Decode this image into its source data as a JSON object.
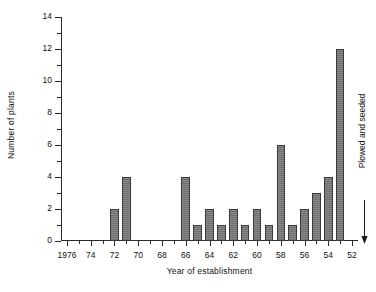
{
  "chart_data": {
    "type": "bar",
    "title": "",
    "xlabel": "Year of establishment",
    "ylabel": "Number of plants",
    "grid": false,
    "legend": null,
    "xlim": [
      1976.5,
      1951.5
    ],
    "ylim": [
      0,
      14
    ],
    "x_axis_direction": "descending",
    "y_major_ticks": [
      0,
      2,
      4,
      6,
      8,
      10,
      12,
      14
    ],
    "y_minor_ticks": [
      1,
      3,
      5,
      7,
      9,
      11,
      13
    ],
    "x_major_tick_labels": [
      "1976",
      "74",
      "72",
      "70",
      "68",
      "66",
      "64",
      "62",
      "60",
      "58",
      "56",
      "54",
      "52"
    ],
    "x_major_tick_years": [
      1976,
      1974,
      1972,
      1970,
      1968,
      1966,
      1964,
      1962,
      1960,
      1958,
      1956,
      1954,
      1952
    ],
    "x_minor_tick_years": [
      1975,
      1973,
      1971,
      1969,
      1967,
      1965,
      1963,
      1961,
      1959,
      1957,
      1955,
      1953
    ],
    "categories": [
      1976,
      1975,
      1974,
      1973,
      1972,
      1971,
      1970,
      1969,
      1968,
      1967,
      1966,
      1965,
      1964,
      1963,
      1962,
      1961,
      1960,
      1959,
      1958,
      1957,
      1956,
      1955,
      1954,
      1953,
      1952
    ],
    "values": [
      0,
      0,
      0,
      0,
      2,
      4,
      0,
      0,
      0,
      0,
      4,
      1,
      2,
      1,
      2,
      1,
      2,
      1,
      6,
      1,
      2,
      3,
      4,
      12,
      0
    ],
    "annotations": [
      {
        "text": "Plowed and seeded",
        "target_year": 1952,
        "arrow": "down"
      }
    ],
    "bar_color": "#808080",
    "bar_edge_color": "#3a3a3a",
    "axis_color": "#2b2b2b"
  },
  "axes": {
    "y_title": "Number of plants",
    "x_title": "Year of establishment"
  },
  "annotation": {
    "label": "Plowed and seeded"
  }
}
